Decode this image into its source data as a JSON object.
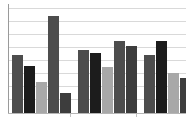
{
  "chart_data": {
    "type": "bar",
    "title": "",
    "subtitle": "",
    "xlabel": "",
    "ylabel": "",
    "categories": [
      "Group 1",
      "Group 2",
      "Group 3"
    ],
    "ylim": [
      0,
      120
    ],
    "xlim": [
      0,
      186
    ],
    "grid": true,
    "gridlines_y": [
      8,
      21,
      34,
      47,
      60,
      73,
      86,
      99,
      113
    ],
    "legend": {
      "visible": false,
      "position": "none"
    },
    "axis": {
      "y_axis_visible": true,
      "x_axis_visible": true,
      "tick_labels_x": [],
      "tick_labels_y": []
    },
    "series": [
      {
        "name": "Series 1",
        "color": "#4d4d4d",
        "values": [
          58,
          63,
          58
        ]
      },
      {
        "name": "Series 2",
        "color": "#1c1c1c",
        "values": [
          47,
          60,
          72
        ]
      },
      {
        "name": "Series 3",
        "color": "#a8a8a8",
        "values": [
          31,
          46,
          40
        ]
      },
      {
        "name": "Series 4",
        "color": "#4d4d4d",
        "values": [
          97,
          72,
          35
        ]
      },
      {
        "name": "Series 5",
        "color": "#3d3d3d",
        "values": [
          20,
          67,
          0
        ]
      }
    ],
    "bars": [
      {
        "group": 0,
        "index": 0,
        "x": 12,
        "width": 11,
        "top": 55,
        "height": 58,
        "color": "#4d4d4d",
        "value": 58
      },
      {
        "group": 0,
        "index": 1,
        "x": 24,
        "width": 11,
        "top": 66,
        "height": 47,
        "color": "#1c1c1c",
        "value": 47
      },
      {
        "group": 0,
        "index": 2,
        "x": 36,
        "width": 11,
        "top": 82,
        "height": 31,
        "color": "#a8a8a8",
        "value": 31
      },
      {
        "group": 0,
        "index": 3,
        "x": 48,
        "width": 11,
        "top": 16,
        "height": 97,
        "color": "#4d4d4d",
        "value": 97
      },
      {
        "group": 0,
        "index": 4,
        "x": 60,
        "width": 11,
        "top": 93,
        "height": 20,
        "color": "#3d3d3d",
        "value": 20
      },
      {
        "group": 1,
        "index": 0,
        "x": 78,
        "width": 11,
        "top": 50,
        "height": 63,
        "color": "#4d4d4d",
        "value": 63
      },
      {
        "group": 1,
        "index": 1,
        "x": 90,
        "width": 11,
        "top": 53,
        "height": 60,
        "color": "#1c1c1c",
        "value": 60
      },
      {
        "group": 1,
        "index": 2,
        "x": 102,
        "width": 11,
        "top": 67,
        "height": 46,
        "color": "#a8a8a8",
        "value": 46
      },
      {
        "group": 1,
        "index": 3,
        "x": 114,
        "width": 11,
        "top": 41,
        "height": 72,
        "color": "#4d4d4d",
        "value": 72
      },
      {
        "group": 1,
        "index": 4,
        "x": 126,
        "width": 11,
        "top": 46,
        "height": 67,
        "color": "#3d3d3d",
        "value": 67
      },
      {
        "group": 2,
        "index": 0,
        "x": 144,
        "width": 11,
        "top": 55,
        "height": 58,
        "color": "#4d4d4d",
        "value": 58
      },
      {
        "group": 2,
        "index": 1,
        "x": 156,
        "width": 11,
        "top": 41,
        "height": 72,
        "color": "#1c1c1c",
        "value": 72
      },
      {
        "group": 2,
        "index": 2,
        "x": 168,
        "width": 11,
        "top": 73,
        "height": 40,
        "color": "#a8a8a8",
        "value": 40
      },
      {
        "group": 2,
        "index": 3,
        "x": 180,
        "width": 11,
        "top": 78,
        "height": 35,
        "color": "#3d3d3d",
        "value": 35
      }
    ],
    "ticks_x": [
      70,
      136
    ],
    "colors": {
      "background": "#ffffff",
      "gridline": "#d9d9d9",
      "axis": "#9a9a9a",
      "bar_dark_gray": "#4d4d4d",
      "bar_black": "#1c1c1c",
      "bar_light_gray": "#a8a8a8",
      "bar_mid_gray": "#3d3d3d"
    }
  }
}
